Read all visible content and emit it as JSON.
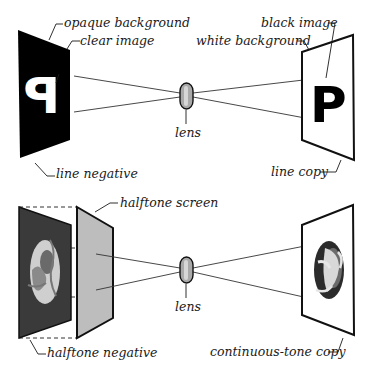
{
  "diagram": {
    "top": {
      "name": "line reproduction",
      "labels": {
        "opaque_background": "opaque background",
        "clear_image": "clear image",
        "line_negative": "line negative",
        "lens": "lens",
        "black_image": "black image",
        "white_background": "white background",
        "line_copy": "line copy"
      },
      "negative_glyph": "P",
      "copy_glyph": "P",
      "colors": {
        "negative_fill": "#000000",
        "glyph_on_negative": "#ffffff",
        "copy_fill": "#ffffff",
        "glyph_on_copy": "#000000"
      }
    },
    "bottom": {
      "name": "halftone reproduction",
      "labels": {
        "halftone_screen": "halftone screen",
        "halftone_negative": "halftone negative",
        "lens": "lens",
        "continuous_tone_copy": "continuous-tone copy"
      },
      "colors": {
        "negative_fill": "#3a3a3a",
        "screen_fill": "#bdbdbd",
        "copy_fill": "#ffffff"
      }
    },
    "lens_colors": {
      "body": "#a9a9a9",
      "highlight": "#d6d6d6",
      "outline": "#111111"
    }
  }
}
